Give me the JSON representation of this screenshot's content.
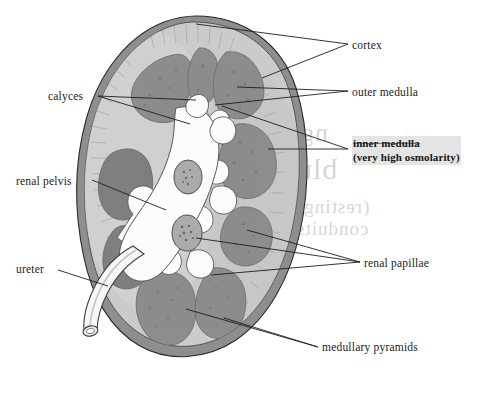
{
  "figure": {
    "medium": "grayscale textbook illustration on paper"
  },
  "labels": {
    "cortex": "cortex",
    "outer_medulla": "outer medulla",
    "inner_medulla": "inner medulla",
    "inner_medulla_note": "(very high osmolarity)",
    "calyces": "calyces",
    "renal_pelvis": "renal pelvis",
    "ureter": "ureter",
    "renal_papillae": "renal papillae",
    "medullary_pyramids": "medullary pyramids"
  },
  "structures": [
    {
      "name": "cortex",
      "shade": "light gray outer band",
      "color": "#c8c8c8"
    },
    {
      "name": "renal capsule",
      "shade": "dark gray rim",
      "color": "#8c8c8c"
    },
    {
      "name": "medullary pyramids",
      "shade": "mid dark gray lobes",
      "color": "#8f8f8f"
    },
    {
      "name": "renal pelvis",
      "shade": "white branching cavity",
      "color": "#fbfbfb"
    },
    {
      "name": "renal papillae",
      "shade": "speckled gray ovals",
      "color": "#a5a5a5"
    },
    {
      "name": "ureter",
      "shade": "white tube with open lumen",
      "color": "#f6f6f6"
    }
  ],
  "colors": {
    "ink": "#1b1b1b",
    "cortex": "#c9c9c9",
    "cortex_light": "#d4d4d4",
    "capsule": "#8a8a8a",
    "pyramid": "#8e8e8e",
    "pyramid_dark": "#7a7a7a",
    "pelvis": "#fcfcfc",
    "papilla": "#a8a8a8",
    "highlight": "rgba(150,150,150,0.26)",
    "background": "#ffffff"
  },
  "background_scrawl": {
    "note": "faint mirrored show-through handwriting from reverse of page",
    "fragments": [
      "ng",
      "blu",
      "(resting)",
      "conduits"
    ]
  }
}
